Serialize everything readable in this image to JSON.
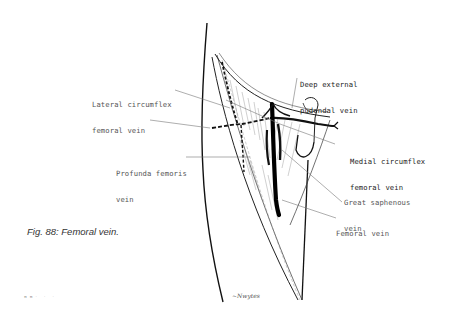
{
  "figure": {
    "caption": "Fig. 88: Femoral vein.",
    "folio": "ππ· ·  ·",
    "signature": "~Nwytes"
  },
  "labels": {
    "lateral_circumflex": {
      "line1": "Lateral circumflex",
      "line2": "femoral vein"
    },
    "deep_external_pudendal": {
      "line1": "Deep external",
      "line2": "pudendal vein"
    },
    "medial_circumflex": {
      "line1": "Medial circumflex",
      "line2": "femoral vein"
    },
    "profunda_femoris": {
      "line1": "Profunda femoris",
      "line2": "vein"
    },
    "great_saphenous": {
      "line1": "Great saphenous",
      "line2": "vein"
    },
    "femoral_vein": {
      "line1": "Femoral vein"
    }
  },
  "colors": {
    "ink": "#111111",
    "leader": "#777777",
    "hatch": "#888888"
  }
}
